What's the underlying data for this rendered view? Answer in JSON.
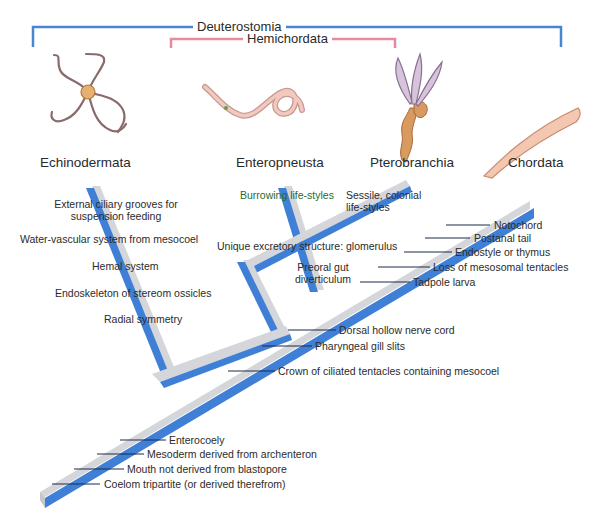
{
  "clades": {
    "outer": {
      "label": "Deuterostomia",
      "color": "#4a86d0"
    },
    "inner": {
      "label": "Hemichordata",
      "color": "#e68aa0"
    }
  },
  "taxa": [
    {
      "label": "Echinodermata"
    },
    {
      "label": "Enteropneusta"
    },
    {
      "label": "Pterobranchia"
    },
    {
      "label": "Chordata"
    }
  ],
  "echinoderm_characters": [
    "External ciliary grooves for",
    "suspension feeding",
    "Water-vascular system from mesocoel",
    "Hemal system",
    "Endoskeleton of stereom ossicles",
    "Radial symmetry"
  ],
  "hemichordate_characters": {
    "burrowing": "Burrowing life-styles",
    "sessile_1": "Sessile, colonial",
    "sessile_2": "life-styles",
    "glomerulus": "Unique excretory structure: glomerulus",
    "preoral_1": "Preoral gut",
    "preoral_2": "diverticulum"
  },
  "chordate_characters": [
    "Notochord",
    "Postanal tail",
    "Endostyle or thymus",
    "Loss of mesosomal tentacles",
    "Tadpole larva"
  ],
  "shared_characters": [
    "Dorsal hollow nerve cord",
    "Pharyngeal gill slits",
    "Crown of ciliated tentacles containing mesocoel"
  ],
  "deuterostome_characters": [
    "Enterocoely",
    "Mesoderm derived from archenteron",
    "Mouth not derived from blastopore",
    "Coelom tripartite (or derived therefrom)"
  ],
  "colors": {
    "branch_blue": "#3f7fd6",
    "branch_gray": "#d4d6da",
    "tick": "#1a2a4a"
  }
}
